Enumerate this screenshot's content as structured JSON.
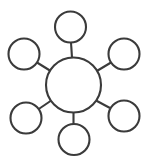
{
  "diagram": {
    "type": "hub-and-spoke",
    "background_color": "#ffffff",
    "stroke_color": "#3b3b3b",
    "fill_color": "#ffffff",
    "stroke_width": 2.1,
    "canvas": {
      "width": 147,
      "height": 165
    },
    "hub": {
      "id": "hub",
      "label": "",
      "cx": 73.5,
      "cy": 85,
      "r": 27.5
    },
    "nodes": [
      {
        "id": "node-top",
        "label": "",
        "cx": 70.5,
        "cy": 27,
        "r": 15.5
      },
      {
        "id": "node-top-left",
        "label": "",
        "cx": 24,
        "cy": 54,
        "r": 15.5
      },
      {
        "id": "node-top-right",
        "label": "",
        "cx": 124,
        "cy": 54,
        "r": 15.5
      },
      {
        "id": "node-bottom-left",
        "label": "",
        "cx": 26,
        "cy": 118,
        "r": 15.5
      },
      {
        "id": "node-bottom-right",
        "label": "",
        "cx": 124,
        "cy": 116,
        "r": 15.5
      },
      {
        "id": "node-bottom",
        "label": "",
        "cx": 74,
        "cy": 139.5,
        "r": 15.5
      }
    ],
    "spokes": [
      {
        "id": "spoke-top",
        "from": "hub",
        "to": "node-top",
        "x1": 72,
        "y1": 57.6,
        "x2": 71,
        "y2": 42.5
      },
      {
        "id": "spoke-top-left",
        "from": "hub",
        "to": "node-top-left",
        "x1": 51.5,
        "y1": 71.5,
        "x2": 37,
        "y2": 62.5
      },
      {
        "id": "spoke-top-right",
        "from": "hub",
        "to": "node-top-right",
        "x1": 96,
        "y1": 71.5,
        "x2": 111,
        "y2": 62.5
      },
      {
        "id": "spoke-bottom-left",
        "from": "hub",
        "to": "node-bottom-left",
        "x1": 52,
        "y1": 100,
        "x2": 38,
        "y2": 109.5
      },
      {
        "id": "spoke-bottom-right",
        "from": "hub",
        "to": "node-bottom-right",
        "x1": 96,
        "y1": 100.5,
        "x2": 110,
        "y2": 108
      },
      {
        "id": "spoke-bottom",
        "from": "hub",
        "to": "node-bottom",
        "x1": 73.5,
        "y1": 112.5,
        "x2": 73.5,
        "y2": 124
      }
    ]
  }
}
